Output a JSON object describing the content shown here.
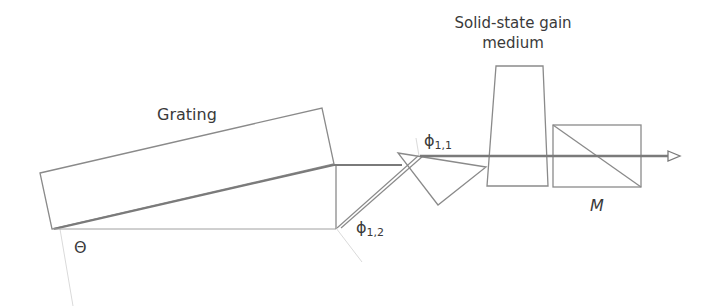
{
  "diagram": {
    "labels": {
      "grating": "Grating",
      "gain_medium_line1": "Solid-state gain",
      "gain_medium_line2": "medium",
      "theta": "Θ",
      "phi11_base": "ϕ",
      "phi11_sub": "1,1",
      "phi12_base": "ϕ",
      "phi12_sub": "1,2",
      "mirror": "M"
    },
    "colors": {
      "line": "#8a8a8a",
      "beam": "#7a7a7a",
      "faint": "#d8d8d8",
      "text": "#3a3a3a"
    },
    "components": [
      {
        "name": "grating",
        "shape": "rotated-rectangle"
      },
      {
        "name": "folding-mirror",
        "shape": "right-triangle"
      },
      {
        "name": "prism",
        "shape": "triangle"
      },
      {
        "name": "gain-medium",
        "shape": "trapezoid"
      },
      {
        "name": "output-coupler-M",
        "shape": "rectangle-with-diagonal"
      },
      {
        "name": "output-beam",
        "shape": "arrow"
      }
    ]
  }
}
